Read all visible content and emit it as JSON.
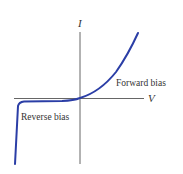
{
  "diagram": {
    "title": "",
    "y_axis_label": "I",
    "x_axis_label": "V",
    "region_labels": {
      "forward": "Forward bias",
      "reverse": "Reverse bias"
    },
    "colors": {
      "curve": "#2b3ea6",
      "axes": "#555555",
      "text": "#333333"
    }
  }
}
